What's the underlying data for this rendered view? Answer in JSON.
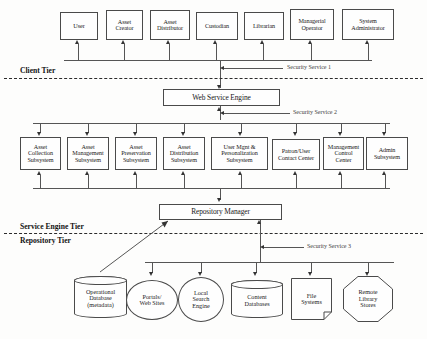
{
  "diagram": {
    "tiers": [
      {
        "id": "client-tier",
        "label": "Client Tier"
      },
      {
        "id": "service-engine-tier",
        "label": "Service Engine Tier"
      },
      {
        "id": "repository-tier",
        "label": "Repository Tier"
      }
    ],
    "security_services": [
      {
        "id": "security-service-1",
        "label": "Security Service 1"
      },
      {
        "id": "security-service-2",
        "label": "Security Service 2"
      },
      {
        "id": "security-service-3",
        "label": "Security Service 3"
      }
    ],
    "client_nodes": [
      {
        "id": "user",
        "label": "User"
      },
      {
        "id": "asset-creator",
        "label": "Asset\nCreator"
      },
      {
        "id": "asset-distributor",
        "label": "Asset\nDistributor"
      },
      {
        "id": "custodian",
        "label": "Custodian"
      },
      {
        "id": "librarian",
        "label": "Librarian"
      },
      {
        "id": "managerial-operator",
        "label": "Managerial\nOperator"
      },
      {
        "id": "system-administrator",
        "label": "System\nAdministrator"
      }
    ],
    "web_service_engine": {
      "id": "web-service-engine",
      "label": "Web Service Engine"
    },
    "subsystems": [
      {
        "id": "asset-collection-subsystem",
        "label": "Asset\nCollection\nSubsystem"
      },
      {
        "id": "asset-management-subsystem",
        "label": "Asset\nManagement\nSubsystem"
      },
      {
        "id": "asset-preservation-subsystem",
        "label": "Asset\nPreservation\nSubsystem"
      },
      {
        "id": "asset-distribution-subsystem",
        "label": "Asset\nDistribution\nSubsystem"
      },
      {
        "id": "user-mgnt-personalization-subsystem",
        "label": "User Mgnt &\nPersonalization\nSubsystem"
      },
      {
        "id": "patron-user-contact-center",
        "label": "Patron/User\nContact Center"
      },
      {
        "id": "management-control-center",
        "label": "Management\nControl\nCenter"
      },
      {
        "id": "admin-subsystem",
        "label": "Admin\nSubsystem"
      }
    ],
    "repository_manager": {
      "id": "repository-manager",
      "label": "Repository Manager"
    },
    "repositories": [
      {
        "id": "operational-database",
        "label": "Operational\nDatabase\n(metadata)",
        "shape": "cylinder"
      },
      {
        "id": "portals-web-sites",
        "label": "Portals/\nWeb Sites",
        "shape": "ellipse"
      },
      {
        "id": "local-search-engine",
        "label": "Local\nSearch\nEngine",
        "shape": "ellipse"
      },
      {
        "id": "content-databases",
        "label": "Content\nDatabases",
        "shape": "cylinder"
      },
      {
        "id": "file-systems",
        "label": "File\nSystems",
        "shape": "document"
      },
      {
        "id": "remote-library-stores",
        "label": "Remote\nLibrary\nStores",
        "shape": "octagon"
      }
    ],
    "colors": {
      "background": "#fdfdfc",
      "stroke": "#4a4a4a",
      "connector": "#555555",
      "text": "#1a1a1a",
      "tier_dash": "#2b2b2b"
    }
  }
}
